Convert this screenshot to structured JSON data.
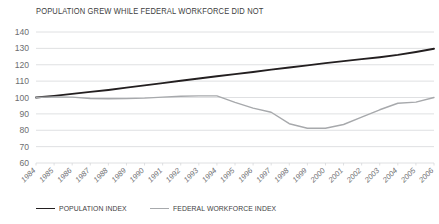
{
  "chart_data": {
    "type": "line",
    "title": "POPULATION GREW WHILE FEDERAL WORKFORCE DID NOT",
    "xlabel": "",
    "ylabel": "",
    "ylim": [
      60,
      140
    ],
    "yticks": [
      60,
      70,
      80,
      90,
      100,
      110,
      120,
      130,
      140
    ],
    "grid": true,
    "legend_position": "bottom-left",
    "categories": [
      "1984",
      "1985",
      "1986",
      "1987",
      "1988",
      "1989",
      "1990",
      "1991",
      "1992",
      "1993",
      "1994",
      "1995",
      "1996",
      "1997",
      "1998",
      "1999",
      "2000",
      "2001",
      "2002",
      "2003",
      "2004",
      "2005",
      "2006"
    ],
    "series": [
      {
        "name": "POPULATION INDEX",
        "color": "#231f20",
        "values": [
          100,
          101,
          102.2,
          103.4,
          104.6,
          106,
          107.4,
          108.8,
          110.2,
          111.6,
          113,
          114.3,
          115.6,
          117,
          118.3,
          119.6,
          121,
          122.2,
          123.4,
          124.6,
          126,
          127.8,
          129.8
        ]
      },
      {
        "name": "FEDERAL WORKFORCE INDEX",
        "color": "#a7a9ac",
        "values": [
          100,
          100.4,
          100.2,
          99.4,
          99.2,
          99.3,
          99.6,
          100.2,
          100.8,
          101,
          101,
          97,
          93.5,
          91,
          84,
          81.2,
          81.2,
          83.5,
          88,
          92.5,
          96.5,
          97.2,
          100
        ]
      }
    ]
  },
  "legend": {
    "items": [
      {
        "label": "POPULATION INDEX",
        "color": "#231f20",
        "width": "1.9px"
      },
      {
        "label": "FEDERAL WORKFORCE INDEX",
        "color": "#a7a9ac",
        "width": "1.4px"
      }
    ]
  }
}
